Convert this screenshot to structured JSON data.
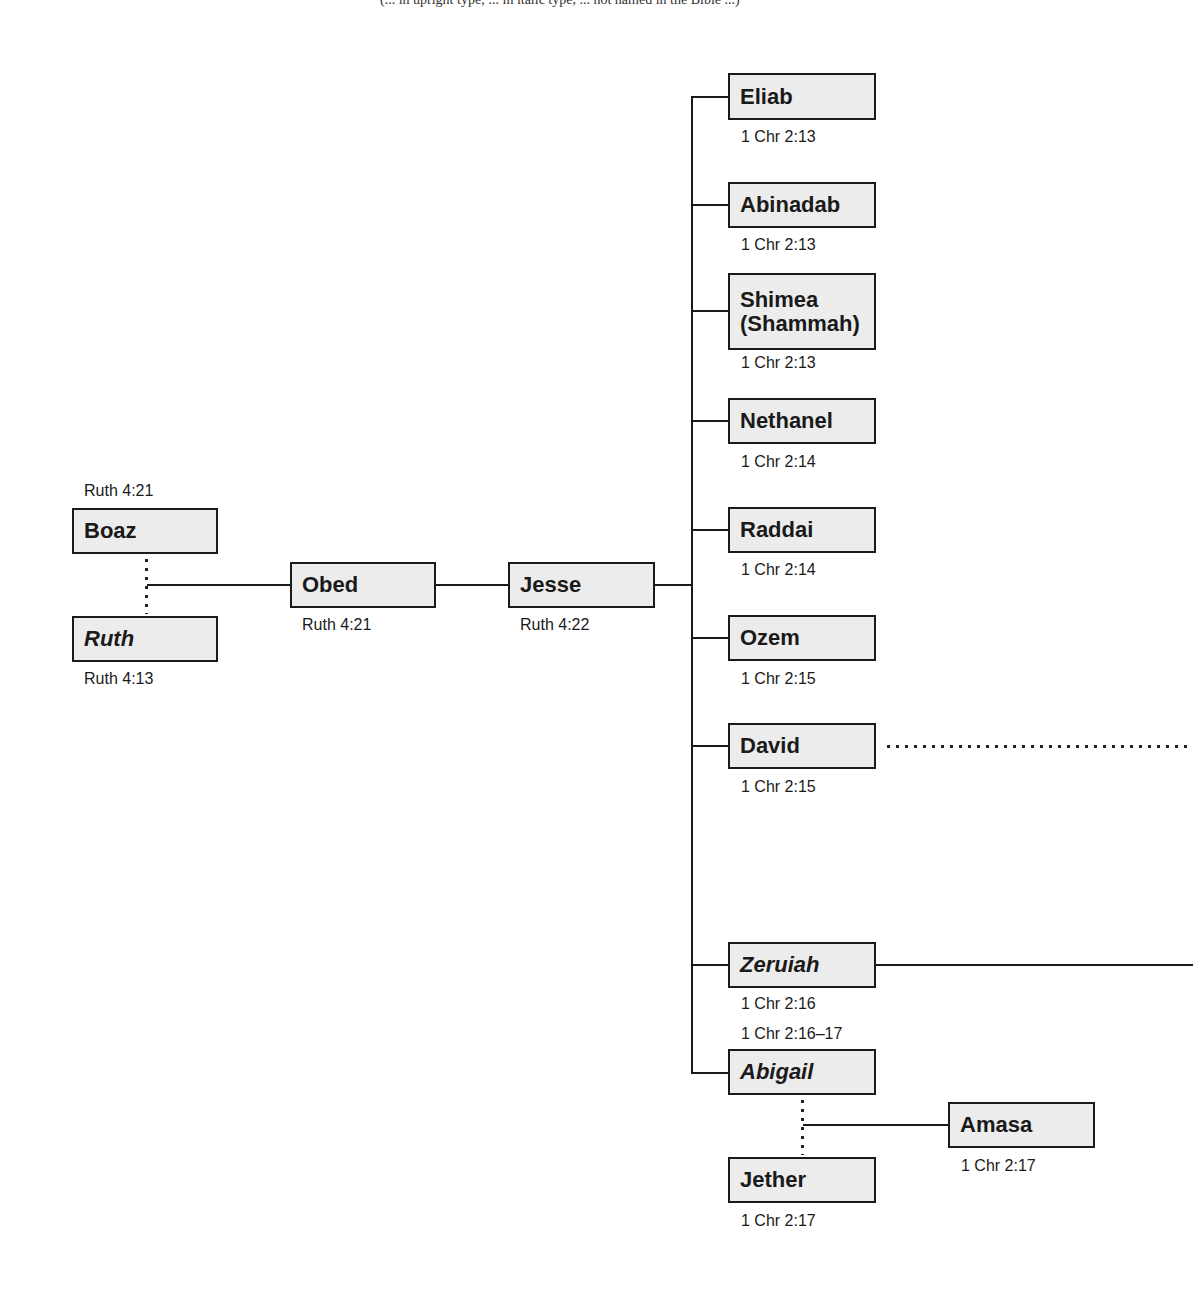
{
  "caption": "(... in upright type; ... in italic type, ... not named in the Bible ...)",
  "nodes": {
    "boaz": {
      "name": "Boaz",
      "italic": false,
      "ref": "Ruth 4:21"
    },
    "ruth": {
      "name": "Ruth",
      "italic": true,
      "ref": "Ruth 4:13"
    },
    "obed": {
      "name": "Obed",
      "italic": false,
      "ref": "Ruth 4:21"
    },
    "jesse": {
      "name": "Jesse",
      "italic": false,
      "ref": "Ruth 4:22"
    },
    "eliab": {
      "name": "Eliab",
      "italic": false,
      "ref": "1 Chr 2:13"
    },
    "abinadab": {
      "name": "Abinadab",
      "italic": false,
      "ref": "1 Chr 2:13"
    },
    "shimea": {
      "name": "Shimea",
      "name_line2": "(Shammah)",
      "italic": false,
      "ref": "1 Chr 2:13"
    },
    "nethanel": {
      "name": "Nethanel",
      "italic": false,
      "ref": "1 Chr 2:14"
    },
    "raddai": {
      "name": "Raddai",
      "italic": false,
      "ref": "1 Chr 2:14"
    },
    "ozem": {
      "name": "Ozem",
      "italic": false,
      "ref": "1 Chr 2:15"
    },
    "david": {
      "name": "David",
      "italic": false,
      "ref": "1 Chr 2:15"
    },
    "zeruiah": {
      "name": "Zeruiah",
      "italic": true,
      "ref": "1 Chr 2:16"
    },
    "abigail": {
      "name": "Abigail",
      "italic": true,
      "ref": "1 Chr 2:16–17"
    },
    "amasa": {
      "name": "Amasa",
      "italic": false,
      "ref": "1 Chr 2:17"
    },
    "jether": {
      "name": "Jether",
      "italic": false,
      "ref": "1 Chr 2:17"
    }
  },
  "relationships": [
    {
      "type": "marriage",
      "style": "dotted",
      "between": [
        "Boaz",
        "Ruth"
      ]
    },
    {
      "type": "child",
      "parents": [
        "Boaz",
        "Ruth"
      ],
      "child": "Obed"
    },
    {
      "type": "child",
      "parent": "Obed",
      "child": "Jesse"
    },
    {
      "type": "children",
      "parent": "Jesse",
      "children": [
        "Eliab",
        "Abinadab",
        "Shimea (Shammah)",
        "Nethanel",
        "Raddai",
        "Ozem",
        "David",
        "Zeruiah",
        "Abigail"
      ]
    },
    {
      "type": "marriage",
      "style": "dotted",
      "between": [
        "Abigail",
        "Jether"
      ]
    },
    {
      "type": "child",
      "parents": [
        "Abigail",
        "Jether"
      ],
      "child": "Amasa"
    },
    {
      "type": "continues-offpage",
      "style": "dotted",
      "from": "David"
    },
    {
      "type": "continues-offpage",
      "style": "solid",
      "from": "Zeruiah"
    }
  ],
  "colors": {
    "box_fill": "#ececec",
    "line": "#1a1a1a",
    "background": "#ffffff"
  }
}
